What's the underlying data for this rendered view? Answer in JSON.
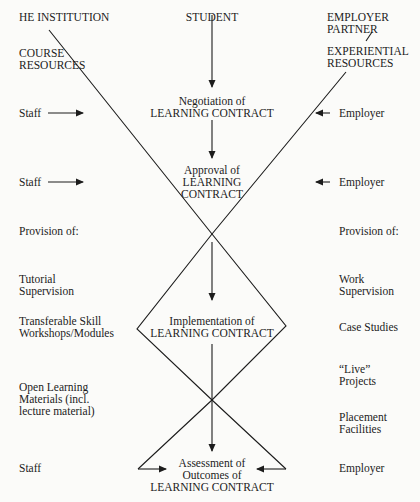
{
  "headers": {
    "left": "HE INSTITUTION",
    "center": "STUDENT",
    "right_line1": "EMPLOYER",
    "right_line2": "PARTNER"
  },
  "resources": {
    "left_line1": "COURSE",
    "left_line2": "RESOURCES",
    "right_line1": "EXPERIENTIAL",
    "right_line2": "RESOURCES"
  },
  "stages": {
    "negotiation_line1": "Negotiation of",
    "negotiation_line2": "LEARNING CONTRACT",
    "approval_line1": "Approval of",
    "approval_line2": "LEARNING",
    "approval_line3": "CONTRACT",
    "implementation_line1": "Implementation of",
    "implementation_line2": "LEARNING CONTRACT",
    "assessment_line1": "Assessment of",
    "assessment_line2": "Outcomes of",
    "assessment_line3": "LEARNING CONTRACT"
  },
  "left_column": {
    "staff_1": "Staff",
    "staff_2": "Staff",
    "provision": "Provision of:",
    "tutorial_1": "Tutorial",
    "tutorial_2": "Supervision",
    "transferable_1": "Transferable Skill",
    "transferable_2": "Workshops/Modules",
    "open_1": "Open Learning",
    "open_2": "Materials (incl.",
    "open_3": "lecture material)",
    "staff_3": "Staff"
  },
  "right_column": {
    "employer_1": "Employer",
    "employer_2": "Employer",
    "provision": "Provision of:",
    "work_1": "Work",
    "work_2": "Supervision",
    "case_studies": "Case Studies",
    "live_1": "“Live”",
    "live_2": "Projects",
    "placement_1": "Placement",
    "placement_2": "Facilities",
    "employer_3": "Employer"
  },
  "colors": {
    "line": "#1c1c1c",
    "background": "#fbfbf9"
  }
}
